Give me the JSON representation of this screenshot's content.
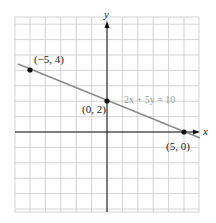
{
  "chart_data": {
    "type": "line",
    "title": "",
    "xlabel": "x",
    "ylabel": "y",
    "xlim": [
      -6,
      6
    ],
    "ylim": [
      -5,
      7
    ],
    "grid": true,
    "series": [
      {
        "name": "2x + 5y = 10",
        "equation": "2x + 5y = 10",
        "x": [
          -6,
          6
        ],
        "y": [
          4.4,
          -0.4
        ],
        "color": "#8a8a8a"
      }
    ],
    "points": [
      {
        "label": "(−5, 4)",
        "x": -5,
        "y": 4
      },
      {
        "label": "(0, 2)",
        "x": 0,
        "y": 2
      },
      {
        "label": "(5, 0)",
        "x": 5,
        "y": 0
      }
    ],
    "annotations": [
      "2x + 5y = 10"
    ]
  },
  "labels": {
    "x_axis": "x",
    "y_axis": "y",
    "equation": "2x + 5y = 10",
    "p1": "(−5, 4)",
    "p2": "(0, 2)",
    "p3": "(5, 0)"
  },
  "colors": {
    "grid": "#c8c8c8",
    "axes": "#111111",
    "line": "#8a8a8a",
    "points": "#111111"
  }
}
